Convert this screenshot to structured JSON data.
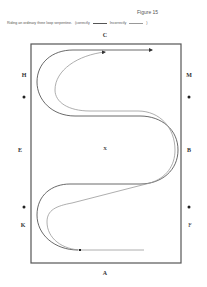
{
  "figure": {
    "title": "Figure 15",
    "caption": {
      "text": "Riding an ordinary three loop serpentine.",
      "correctly_label": "(correctly",
      "incorrectly_label": "Incorrectly",
      "close": ")"
    }
  },
  "arena": {
    "letters": {
      "top": "C",
      "bottom": "A",
      "left_top": "H",
      "left_mid": "E",
      "left_bottom": "K",
      "right_top": "M",
      "right_mid": "B",
      "right_bottom": "F",
      "center": "X"
    },
    "markers": [
      {
        "name": "left-upper-marker",
        "x": 24,
        "y": 97
      },
      {
        "name": "left-lower-marker",
        "x": 24,
        "y": 207
      },
      {
        "name": "right-upper-marker",
        "x": 189,
        "y": 97
      },
      {
        "name": "right-lower-marker",
        "x": 189,
        "y": 207
      }
    ],
    "colors": {
      "border": "#555555",
      "correct_path": "#444444",
      "incorrect_path": "#999999"
    }
  }
}
